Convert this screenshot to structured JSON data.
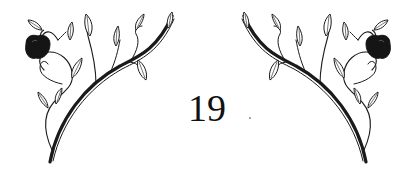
{
  "page": {
    "number": "19"
  },
  "decoration": {
    "left_ornament": "apple-vine-flourish",
    "right_ornament": "apple-vine-flourish-mirrored",
    "ink_color": "#1a1a1a",
    "apple_color": "#151515",
    "background": "#ffffff"
  }
}
